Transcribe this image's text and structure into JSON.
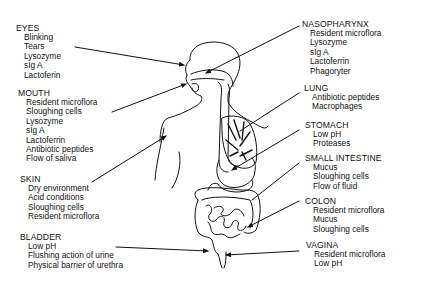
{
  "diagram": {
    "left_labels": [
      {
        "id": "eyes",
        "title": "EYES",
        "items": [
          "Blinking",
          "Tears",
          "Lysozyme",
          "sIg A",
          "Lactoferin"
        ]
      },
      {
        "id": "mouth",
        "title": "MOUTH",
        "items": [
          "Resident microflora",
          "Sloughing cells",
          "Lysozyme",
          "sIg A",
          "Lactoferrin",
          "Antibiotic peptides",
          "Flow of saliva"
        ]
      },
      {
        "id": "skin",
        "title": "SKIN",
        "items": [
          "Dry environment",
          "Acid conditions",
          "Sloughing cells",
          "Resident microflora"
        ]
      },
      {
        "id": "bladder",
        "title": "BLADDER",
        "items": [
          "Low pH",
          "Flushing action of urine",
          "Physical barrier of urethra"
        ]
      }
    ],
    "right_labels": [
      {
        "id": "nasopharynx",
        "title": "NASOPHARYNX",
        "items": [
          "Resident microflora",
          "Lysozyme",
          "sIg A",
          "Lactoferrin",
          "Phagoryter"
        ]
      },
      {
        "id": "lung",
        "title": "LUNG",
        "items": [
          "Antibiotic peptides",
          "Macrophages"
        ]
      },
      {
        "id": "stomach",
        "title": "STOMACH",
        "items": [
          "Low pH",
          "Proteases"
        ]
      },
      {
        "id": "small_intestine",
        "title": "SMALL INTESTINE",
        "items": [
          "Mucus",
          "Sloughing cells",
          "Flow of fluid"
        ]
      },
      {
        "id": "colon",
        "title": "COLON",
        "items": [
          "Resident microflora",
          "Mucus",
          "Sloughing cells"
        ]
      },
      {
        "id": "vagina",
        "title": "VAGINA",
        "items": [
          "Resident microflora",
          "Low pH"
        ]
      }
    ]
  }
}
